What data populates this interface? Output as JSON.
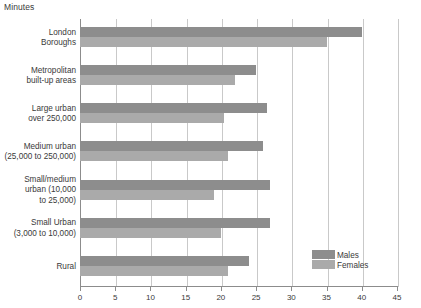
{
  "chart_data": {
    "type": "bar",
    "orientation": "horizontal",
    "title": "",
    "axis_note": "Minutes",
    "xlabel": "",
    "ylabel": "",
    "xlim": [
      0,
      45
    ],
    "xticks": [
      0,
      5,
      10,
      15,
      20,
      25,
      30,
      35,
      40,
      45
    ],
    "grid": true,
    "legend_position": "bottom-right",
    "categories": [
      "London Boroughs",
      "Metropolitan built-up areas",
      "Large urban over 250,000",
      "Medium urban (25,000 to 250,000)",
      "Small/medium urban (10,000 to 25,000)",
      "Small Urban (3,000 to 10,000)",
      "Rural"
    ],
    "category_lines": [
      [
        "London",
        "Boroughs"
      ],
      [
        "Metropolitan",
        "built-up areas"
      ],
      [
        "Large urban",
        "over 250,000"
      ],
      [
        "Medium urban",
        "(25,000 to 250,000)"
      ],
      [
        "Small/medium",
        "urban (10,000",
        "to 25,000)"
      ],
      [
        "Small Urban",
        "(3,000 to 10,000)"
      ],
      [
        "Rural"
      ]
    ],
    "series": [
      {
        "name": "Males",
        "color": "#8d8d8d",
        "values": [
          40,
          25,
          26.5,
          26,
          27,
          27,
          24
        ]
      },
      {
        "name": "Females",
        "color": "#aaaaaa",
        "values": [
          35,
          22,
          20.5,
          21,
          19,
          20,
          21
        ]
      }
    ]
  },
  "legend": {
    "entries": [
      {
        "label": "Males"
      },
      {
        "label": "Females"
      }
    ]
  },
  "colors": {
    "males": "#8d8d8d",
    "females": "#aaaaaa",
    "gridline": "#c9c9c9",
    "axis": "#8c8c8c",
    "text": "#3a3a3a",
    "background": "#ffffff"
  }
}
